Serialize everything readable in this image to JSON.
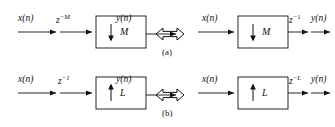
{
  "figure": {
    "background_color": "#ffffff",
    "line_color": "#111111",
    "rows": [
      {
        "caption": "(a)",
        "equivalence_symbol": "double-headed-arrow",
        "left": {
          "input_label": "x(n)",
          "delay_label_base": "z",
          "delay_label_exponent": "−M",
          "block_operation": "downsample",
          "block_arrow": "↓",
          "block_factor": "M",
          "output_label": "y(n)"
        },
        "right": {
          "input_label": "x(n)",
          "delay_label_base": "z",
          "delay_label_exponent": "−1",
          "block_operation": "downsample",
          "block_arrow": "↓",
          "block_factor": "M",
          "output_label": "y(n)"
        }
      },
      {
        "caption": "(b)",
        "equivalence_symbol": "double-headed-arrow",
        "left": {
          "input_label": "x(n)",
          "delay_label_base": "z",
          "delay_label_exponent": "−1",
          "block_operation": "upsample",
          "block_arrow": "↑",
          "block_factor": "L",
          "output_label": "y(n)"
        },
        "right": {
          "input_label": "x(n)",
          "delay_label_base": "z",
          "delay_label_exponent": "−L",
          "block_operation": "upsample",
          "block_arrow": "↑",
          "block_factor": "L",
          "output_label": "y(n)"
        }
      }
    ]
  }
}
